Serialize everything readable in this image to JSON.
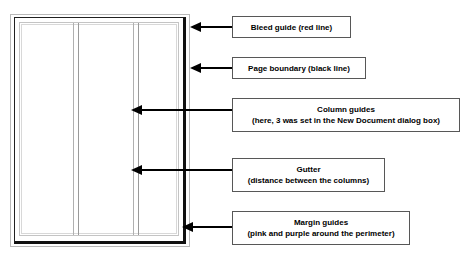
{
  "diagram": {
    "page": {
      "columns_count": 3,
      "guide_colors": {
        "bleed": "#ff0000",
        "page_boundary": "#000000",
        "column_guide": "#b0b0b0",
        "margin_pink": "#ff69b4",
        "margin_purple": "#800080"
      }
    },
    "callouts": [
      {
        "id": "bleed-guide",
        "line1": "Bleed guide (red line)",
        "line2": ""
      },
      {
        "id": "page-boundary",
        "line1": "Page boundary (black line)",
        "line2": ""
      },
      {
        "id": "column-guides",
        "line1": "Column guides",
        "line2": "(here, 3 was set in the New Document dialog box)"
      },
      {
        "id": "gutter",
        "line1": "Gutter",
        "line2": "(distance between the columns)"
      },
      {
        "id": "margin-guides",
        "line1": "Margin guides",
        "line2": "(pink and purple around the perimeter)"
      }
    ]
  }
}
